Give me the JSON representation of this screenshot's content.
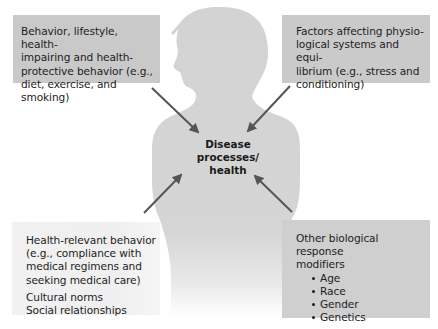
{
  "diagram": {
    "center": {
      "label_line1": "Disease processes/",
      "label_line2": "health"
    },
    "boxes": {
      "top_left": {
        "text": "Behavior, lifestyle, health-impairing and health-protective behavior (e.g., diet, exercise, and smoking)",
        "lines": [
          "Behavior, lifestyle, health-",
          "impairing and health-",
          "protective behavior (e.g.,",
          "diet, exercise, and smoking)"
        ]
      },
      "top_right": {
        "text": "Factors affecting physiological systems and equilibrium (e.g., stress and conditioning)",
        "lines": [
          "Factors affecting physio-",
          "logical systems and equi-",
          "librium (e.g., stress and",
          "conditioning)"
        ]
      },
      "bottom_left": {
        "lines": [
          "Health-relevant behavior",
          "(e.g., compliance with",
          "medical regimens and",
          "seeking medical care)"
        ],
        "extra_lines": [
          "Cultural norms",
          "Social relationships"
        ]
      },
      "bottom_right": {
        "heading_lines": [
          "Other biological response",
          "modifiers"
        ],
        "bullets": [
          "Age",
          "Race",
          "Gender",
          "Genetics"
        ]
      }
    },
    "arrows": [
      {
        "from": "top_left",
        "to": "center"
      },
      {
        "from": "top_right",
        "to": "center"
      },
      {
        "from": "bottom_left",
        "to": "center"
      },
      {
        "from": "bottom_right",
        "to": "center"
      }
    ],
    "colors": {
      "silhouette": "#d3d3d3",
      "box_gray": "#c9c9c9",
      "box_light": "#f0f0f0",
      "arrow": "#555555",
      "text": "#1d1d1d"
    }
  }
}
